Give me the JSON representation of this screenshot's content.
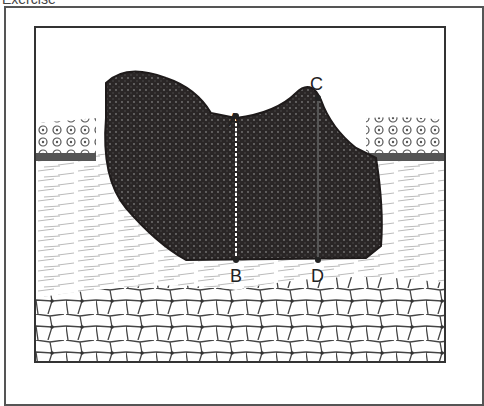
{
  "header": {
    "title": "Exercise"
  },
  "diagram": {
    "labels": {
      "a": "A",
      "b": "B",
      "c": "C",
      "d": "D"
    },
    "layers": [
      "epidermis",
      "dermis",
      "subcutaneous fat"
    ],
    "colors": {
      "lesion": "#2a2626",
      "frame": "#333333",
      "fat_outline": "#444444"
    }
  }
}
